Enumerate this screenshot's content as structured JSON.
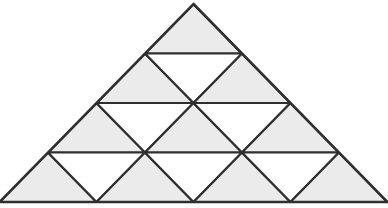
{
  "figure": {
    "rows": 4,
    "total_small_triangles": 16,
    "upward_count": 10,
    "downward_count": 6,
    "colors": {
      "shaded_fill": "#ebebeb",
      "unshaded_fill": "#ffffff",
      "stroke": "#2f2f2f",
      "background": "#ffffff"
    },
    "stroke_width": 2.2,
    "geometry": {
      "apex_x": 193.5,
      "apex_y": 4,
      "base_left_x": 8,
      "base_right_x": 380,
      "base_y": 202,
      "row_height": 49.5,
      "row_baselines": [
        53.5,
        103,
        152.5,
        202
      ]
    },
    "triangles": [
      {
        "id": "r1-u1",
        "row": 1,
        "index": 1,
        "orientation": "up",
        "shaded": true,
        "points": "193.5,4 242,53.5 145,53.5"
      },
      {
        "id": "r2-u1",
        "row": 2,
        "index": 1,
        "orientation": "up",
        "shaded": true,
        "points": "145,53.5 193.5,103 96.5,103"
      },
      {
        "id": "r2-d1",
        "row": 2,
        "index": 2,
        "orientation": "down",
        "shaded": false,
        "points": "145,53.5 242,53.5 193.5,103"
      },
      {
        "id": "r2-u2",
        "row": 2,
        "index": 3,
        "orientation": "up",
        "shaded": true,
        "points": "242,53.5 290.5,103 193.5,103"
      },
      {
        "id": "r3-u1",
        "row": 3,
        "index": 1,
        "orientation": "up",
        "shaded": true,
        "points": "96.5,103 145,152.5 48,152.5"
      },
      {
        "id": "r3-d1",
        "row": 3,
        "index": 2,
        "orientation": "down",
        "shaded": false,
        "points": "96.5,103 193.5,103 145,152.5"
      },
      {
        "id": "r3-u2",
        "row": 3,
        "index": 3,
        "orientation": "up",
        "shaded": true,
        "points": "193.5,103 242,152.5 145,152.5"
      },
      {
        "id": "r3-d2",
        "row": 3,
        "index": 4,
        "orientation": "down",
        "shaded": false,
        "points": "193.5,103 290.5,103 242,152.5"
      },
      {
        "id": "r3-u3",
        "row": 3,
        "index": 5,
        "orientation": "up",
        "shaded": true,
        "points": "290.5,103 339,152.5 242,152.5"
      },
      {
        "id": "r4-u1",
        "row": 4,
        "index": 1,
        "orientation": "up",
        "shaded": true,
        "points": "48,152.5 96.5,202 -0.5,202"
      },
      {
        "id": "r4-d1",
        "row": 4,
        "index": 2,
        "orientation": "down",
        "shaded": false,
        "points": "48,152.5 145,152.5 96.5,202"
      },
      {
        "id": "r4-u2",
        "row": 4,
        "index": 3,
        "orientation": "up",
        "shaded": true,
        "points": "145,152.5 193.5,202 96.5,202"
      },
      {
        "id": "r4-d2",
        "row": 4,
        "index": 4,
        "orientation": "down",
        "shaded": false,
        "points": "145,152.5 242,152.5 193.5,202"
      },
      {
        "id": "r4-u3",
        "row": 4,
        "index": 5,
        "orientation": "up",
        "shaded": true,
        "points": "242,152.5 290.5,202 193.5,202"
      },
      {
        "id": "r4-d3",
        "row": 4,
        "index": 6,
        "orientation": "down",
        "shaded": false,
        "points": "242,152.5 339,152.5 290.5,202"
      },
      {
        "id": "r4-u4",
        "row": 4,
        "index": 7,
        "orientation": "up",
        "shaded": true,
        "points": "339,152.5 387.5,202 290.5,202"
      }
    ],
    "clip_outline": "193.5,4 387.5,202 -0.5,202"
  }
}
